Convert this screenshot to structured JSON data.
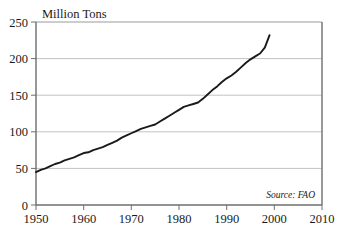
{
  "chart_data": {
    "type": "line",
    "title": "Million Tons",
    "xlabel": "",
    "ylabel": "",
    "xlim": [
      1950,
      2010
    ],
    "ylim": [
      0,
      250
    ],
    "grid": true,
    "legend": null,
    "annotation": "Source: FAO",
    "yticks": [
      "0",
      "50",
      "100",
      "150",
      "200",
      "250"
    ],
    "ytick_values": [
      0,
      50,
      100,
      150,
      200,
      250
    ],
    "xticks": [
      "1950",
      "1960",
      "1970",
      "1980",
      "1990",
      "2000",
      "2010"
    ],
    "xtick_values": [
      1950,
      1960,
      1970,
      1980,
      1990,
      2000,
      2010
    ],
    "series": [
      {
        "name": "World Meat Production",
        "color": "#1a1a1a",
        "x": [
          1950,
          1951,
          1952,
          1953,
          1954,
          1955,
          1956,
          1957,
          1958,
          1959,
          1960,
          1961,
          1962,
          1963,
          1964,
          1965,
          1966,
          1967,
          1968,
          1969,
          1970,
          1971,
          1972,
          1973,
          1974,
          1975,
          1976,
          1977,
          1978,
          1979,
          1980,
          1981,
          1982,
          1983,
          1984,
          1985,
          1986,
          1987,
          1988,
          1989,
          1990,
          1991,
          1992,
          1993,
          1994,
          1995,
          1996,
          1997,
          1998,
          1999
        ],
        "values": [
          45,
          48,
          50,
          53,
          56,
          58,
          61,
          63,
          65,
          68,
          71,
          72,
          75,
          77,
          79,
          82,
          85,
          88,
          92,
          95,
          98,
          101,
          104,
          106,
          108,
          110,
          114,
          118,
          122,
          126,
          130,
          134,
          136,
          138,
          140,
          145,
          151,
          157,
          162,
          168,
          173,
          177,
          182,
          188,
          194,
          199,
          203,
          207,
          215,
          232
        ]
      }
    ]
  },
  "axis": {
    "ytitle": "Million Tons",
    "source": "Source: FAO"
  }
}
